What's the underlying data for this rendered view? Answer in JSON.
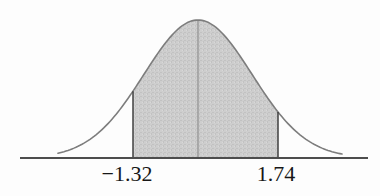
{
  "figure": {
    "kind": "normal-distribution-figure"
  },
  "chart_data": {
    "type": "area",
    "distribution": "standard normal (bell curve)",
    "title": "",
    "xlabel": "",
    "ylabel": "",
    "grid": false,
    "legend": false,
    "shaded_region": {
      "from_z": -1.32,
      "to_z": 1.74
    },
    "mean_line_z": 0,
    "axis_range_z": [
      -3.3,
      3.2
    ],
    "curve_range_z": [
      -2.6,
      2.7
    ],
    "x_ticks": [
      {
        "value": -1.32,
        "label": "−1.32"
      },
      {
        "value": 1.74,
        "label": "1.74"
      }
    ],
    "colors": {
      "curve": "#7d7d7d",
      "fill_base": "#cecece",
      "fill_texture_dark": "#c2c2c2",
      "fill_texture_light": "#d8d8d8",
      "boundary_line": "#3f3f3f",
      "mean_line": "#8f8f8f",
      "axis": "#4d4d4d",
      "label_text": "#171717",
      "background": "#fdfdfd"
    }
  }
}
